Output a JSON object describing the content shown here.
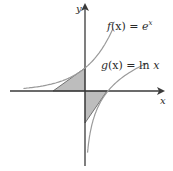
{
  "diagram": {
    "functions": [
      {
        "id": "f",
        "label_prefix": "f",
        "label_arg": "(x) = ",
        "label_expr": "e",
        "label_sup": "x",
        "expr": "exp(x)"
      },
      {
        "id": "g",
        "label_prefix": "g",
        "label_arg": "(x) = ",
        "label_expr": "ln",
        "label_var": " x",
        "expr": "ln(x)"
      }
    ],
    "axes": {
      "x_label": "x",
      "y_label": "y"
    },
    "shaded_regions": [
      {
        "name": "region-under-tangent-of-f",
        "vertices": [
          [
            -1,
            0
          ],
          [
            0,
            0
          ],
          [
            0,
            1
          ]
        ]
      },
      {
        "name": "region-above-tangent-of-g",
        "vertices": [
          [
            0,
            0
          ],
          [
            1,
            0
          ],
          [
            0,
            -1
          ]
        ]
      }
    ],
    "colors": {
      "curve": "#9a9a9a",
      "axis": "#3a3a3a",
      "shade": "#bdbdbd",
      "shade_edge": "#555555"
    }
  }
}
